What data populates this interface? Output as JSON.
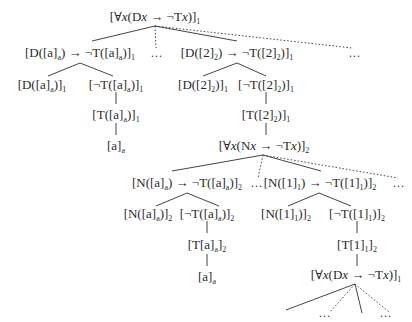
{
  "diagram": {
    "type": "proof-tree",
    "colors": {
      "text": "#2a2a2a",
      "line": "#444444",
      "background": "#ffffff"
    },
    "nodes": {
      "root": {
        "text": "[∀x(Dx → ¬Tx)]",
        "sub": "1"
      },
      "n_a_cond": {
        "text": "[D([a]ₐ) → ¬T([a]ₐ)]",
        "sub": "1"
      },
      "n_a_d": {
        "text": "[D([a]ₐ)]",
        "sub": "1"
      },
      "n_a_negt": {
        "text": "[¬T([a]ₐ)]",
        "sub": "1"
      },
      "n_a_t": {
        "text": "[T([a]ₐ)]",
        "sub": "1"
      },
      "n_a_leaf": {
        "text": "[a]",
        "sub": "a"
      },
      "n_2_cond": {
        "text": "[D([2]₂) → ¬T([2]₂)]",
        "sub": "1"
      },
      "n_2_d": {
        "text": "[D([2]₂)]",
        "sub": "1"
      },
      "n_2_negt": {
        "text": "[¬T([2]₂)]",
        "sub": "1"
      },
      "n_2_t": {
        "text": "[T([2]₂)]",
        "sub": "1"
      },
      "n_nx": {
        "text": "[∀x(Nx → ¬Tx)]",
        "sub": "2"
      },
      "n_na_cond": {
        "text": "[N([a]ₐ) → ¬T([a]ₐ)]",
        "sub": "2"
      },
      "n_na_n": {
        "text": "[N([a]ₐ)]",
        "sub": "2"
      },
      "n_na_negt": {
        "text": "[¬T([a]ₐ)]",
        "sub": "2"
      },
      "n_na_t": {
        "text": "[T[a]ₐ]",
        "sub": "2"
      },
      "n_na_leaf": {
        "text": "[a]",
        "sub": "a"
      },
      "n_n1_cond": {
        "text": "[N([1]₁) → ¬T([1]₁)]",
        "sub": "2"
      },
      "n_n1_n": {
        "text": "[N([1]₁)]",
        "sub": "2"
      },
      "n_n1_negt": {
        "text": "[¬T([1]₁)]",
        "sub": "2"
      },
      "n_n1_t": {
        "text": "[T[1]₁]",
        "sub": "2"
      },
      "n_dx2": {
        "text": "[∀x(Dx → ¬Tx)]",
        "sub": "1"
      }
    },
    "ellipsis": "…"
  }
}
